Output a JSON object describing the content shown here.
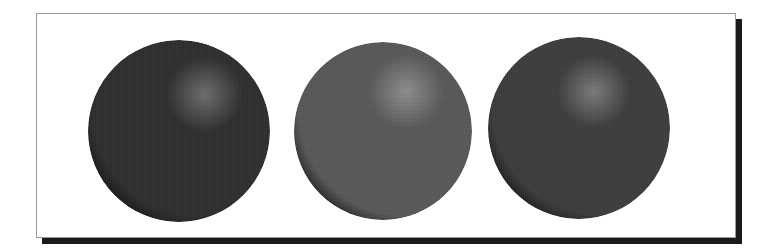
{
  "figure": {
    "frame": {
      "background": "#ffffff",
      "border_color": "#9a9a9a",
      "shadow_color": "#1a1a1a"
    },
    "spheres": [
      {
        "name": "sphere-dark",
        "cx": 179,
        "cy": 131,
        "r": 91,
        "base_color": "#2e2e2e",
        "highlight_color": "#6e6e6e",
        "shadow_color": "#141414",
        "highlight_pos": [
          64,
          30
        ]
      },
      {
        "name": "sphere-light",
        "cx": 383,
        "cy": 131,
        "r": 89,
        "base_color": "#595959",
        "highlight_color": "#8f8f8f",
        "shadow_color": "#1c1c1c",
        "highlight_pos": [
          63,
          28
        ]
      },
      {
        "name": "sphere-medium",
        "cx": 579,
        "cy": 128,
        "r": 91,
        "base_color": "#3d3d3d",
        "highlight_color": "#7c7c7c",
        "shadow_color": "#161616",
        "highlight_pos": [
          58,
          30
        ]
      }
    ]
  }
}
